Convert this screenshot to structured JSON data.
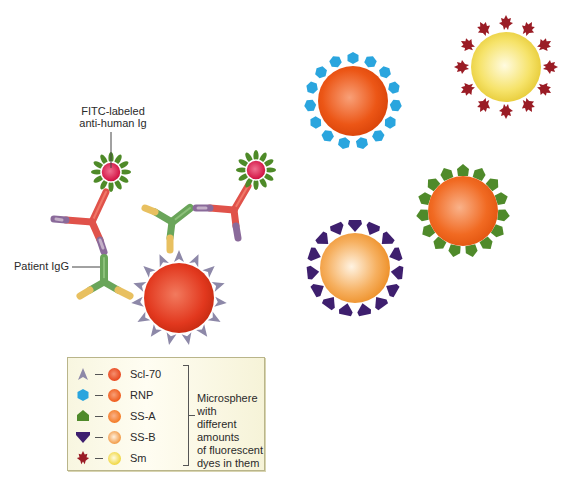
{
  "labels": {
    "fitc": "FITC-labeled anti-human Ig",
    "fitc_line1": "FITC-labeled",
    "fitc_line2": "anti-human Ig",
    "patient_igg": "Patient IgG"
  },
  "legend": {
    "items": [
      {
        "antigen": "Scl-70",
        "antigen_shape": "triangle-spike",
        "shape_color": "#8d88a8",
        "bead_color": "#e8461c"
      },
      {
        "antigen": "RNP",
        "antigen_shape": "hexagon",
        "shape_color": "#2aa5de",
        "bead_color": "#ef5a1a"
      },
      {
        "antigen": "SS-A",
        "antigen_shape": "pentagon-house",
        "shape_color": "#4f8a2a",
        "bead_color": "#f47a22"
      },
      {
        "antigen": "SS-B",
        "antigen_shape": "diamond-gem",
        "shape_color": "#3e1f6e",
        "bead_color": "#f3a050"
      },
      {
        "antigen": "Sm",
        "antigen_shape": "maple-leaf",
        "shape_color": "#9a1c25",
        "bead_color": "#f1d94a"
      }
    ],
    "description_lines": [
      "Microsphere with",
      "different amounts",
      "of fluorescent",
      "dyes in them"
    ],
    "description": "Microsphere with different amounts of fluorescent dyes in them"
  },
  "microspheres": [
    {
      "name": "Scl-70",
      "cx": 179,
      "cy": 298,
      "color": "#e0341c",
      "highlight": "#f06a4a",
      "antigen_color": "#8d88a8"
    },
    {
      "name": "RNP",
      "cx": 353,
      "cy": 101,
      "color": "#ea4e12",
      "highlight": "#f79a6a",
      "antigen_color": "#2aa5de"
    },
    {
      "name": "Sm",
      "cx": 506,
      "cy": 67,
      "color": "#efd63a",
      "highlight": "#fffbd8",
      "antigen_color": "#9a1c25"
    },
    {
      "name": "SS-A",
      "cx": 463,
      "cy": 211,
      "color": "#f0621a",
      "highlight": "#f9b088",
      "antigen_color": "#4f8a2a"
    },
    {
      "name": "SS-B",
      "cx": 355,
      "cy": 268,
      "color": "#f29a30",
      "highlight": "#fff0dc",
      "antigen_color": "#3e1f6e"
    }
  ],
  "fitc_conjugates": [
    {
      "cx": 111,
      "cy": 172,
      "core": "#d4184a",
      "petals": "#4e8a28"
    },
    {
      "cx": 256,
      "cy": 170,
      "core": "#d4184a",
      "petals": "#4e8a28"
    }
  ],
  "colors": {
    "anti_human_ig": "#e0524a",
    "patient_igg": "#6aa55a",
    "fab_tip_patient": "#e8c060",
    "fab_tip_anti": "#8a6a9a"
  }
}
